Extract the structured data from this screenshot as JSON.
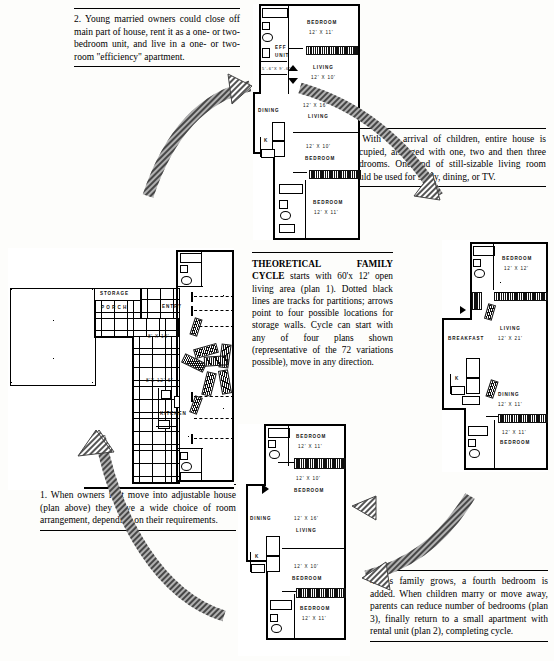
{
  "captions": {
    "c2": "2.  Young  married  owners  could  close  off main part of house, rent it as a one- or two-bedroom  unit,  and  live  in  a  one-  or  two-room \"efficiency\" apartment.",
    "c3": "3. With the arrival of children, entire house is  occupied,  arranged  with  one,  two  and then three bedrooms. One end of still-sizable living room could be used for study, dining, or TV.",
    "c1": "1.  When  owners  first  move  into  adjustable house (plan above) they have a wide choice of  room  arrangement,  depending  on  their requirements.",
    "c4": "4.  As family grows, a fourth bedroom is added. When children marry or move away, parents  can  reduce  number  of  bedrooms (plan 3), finally return to a small apartment with rental unit (plan 2), completing cycle."
  },
  "center_note": {
    "heading": "THEORETICAL FAMILY CYCLE",
    "body": "starts with 60'x 12' open living area (plan 1). Dotted black lines are tracks for  partitions;  arrows  point  to  four possible  locations  for  storage  walls. Cycle can start with any of four plans shown   (representative   of   the   72 variations  possible),  move  in  any direction."
  },
  "plan2": {
    "name": "plan-2-top",
    "rooms": [
      {
        "label": "BEDROOM",
        "dim": "12' X 11'"
      },
      {
        "label": "EFF",
        "dim": "UNIT"
      },
      {
        "label": "5'-6\"X 9'-6\"",
        "dim": ""
      },
      {
        "label": "LIVING",
        "dim": "12' X 10'"
      },
      {
        "label": "DINING",
        "dim": ""
      },
      {
        "label": "LIVING",
        "dim": "12' X 16'"
      },
      {
        "label": "BEDROOM",
        "dim": "12' X 10'"
      },
      {
        "label": "BEDROOM",
        "dim": "12' X 11'"
      },
      {
        "label": "K",
        "dim": ""
      }
    ]
  },
  "plan1": {
    "name": "plan-1-left",
    "rooms": [
      {
        "label": "STORAGE",
        "dim": ""
      },
      {
        "label": "PORCH",
        "dim": ""
      },
      {
        "label": "ENTRY",
        "dim": ""
      },
      {
        "label": "KITCHEN",
        "dim": ""
      },
      {
        "label": "",
        "dim": "8' X 10'"
      },
      {
        "label": "",
        "dim": "8'X 12'-6\""
      }
    ]
  },
  "plan3": {
    "name": "plan-3-right",
    "rooms": [
      {
        "label": "BEDROOM",
        "dim": "12' X 12'"
      },
      {
        "label": "LIVING",
        "dim": "12' X 21'"
      },
      {
        "label": "BREAKFAST",
        "dim": ""
      },
      {
        "label": "K",
        "dim": ""
      },
      {
        "label": "DINING",
        "dim": "12' X 11'"
      },
      {
        "label": "BEDROOM",
        "dim": "12' X 11'"
      }
    ]
  },
  "plan4": {
    "name": "plan-4-bottom",
    "rooms": [
      {
        "label": "BEDROOM",
        "dim": "12' X 11'"
      },
      {
        "label": "BEDROOM",
        "dim": "12' X 10'"
      },
      {
        "label": "DINING",
        "dim": ""
      },
      {
        "label": "LIVING",
        "dim": "12' X 16'"
      },
      {
        "label": "BEDROOM",
        "dim": "12' X 10'"
      },
      {
        "label": "BEDROOM",
        "dim": "12' X 11'"
      },
      {
        "label": "K",
        "dim": ""
      }
    ]
  },
  "colors": {
    "ink": "#000000",
    "paper": "#ffffff",
    "wall": "#111111"
  }
}
